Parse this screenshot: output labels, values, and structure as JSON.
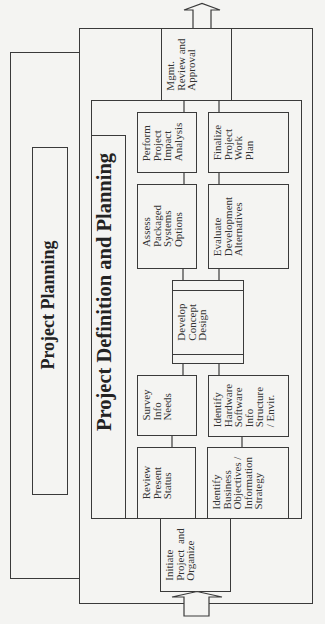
{
  "diagram": {
    "outer_label": "Project Planning",
    "inner_label": "Project Definition and Planning",
    "nodes": {
      "mgmt_review": "Mgmt.\nReview and\nApproval",
      "perform_impact": "Perform\nProject\nImpact\nAnalysis",
      "finalize_plan": "Finalize\nProject\nWork\nPlan",
      "assess_packaged": "Assess\nPackaged\nSystems\nOptions",
      "evaluate_alternatives": "Evaluate\nDevelopment\nAlternatives",
      "develop_concept": "Develop\nConcept\nDesign",
      "survey_needs": "Survey\nInfo\nNeeds",
      "identify_hardware": "Identify\nHardware\nSoftware\nInfo\nStructure\n/ Envir.",
      "review_status": "Review\nPresent\nStatus",
      "identify_business": "Identify\nBusiness\nObjectives /\nInformation\nStrategy",
      "initiate": "Initiate\nProject  and\nOrganize"
    },
    "arrows": {
      "input": "up-arrow-icon",
      "output": "up-arrow-icon"
    }
  },
  "colors": {
    "line": "#3a3a3a",
    "text": "#333333",
    "background": "#f4f4f2"
  }
}
